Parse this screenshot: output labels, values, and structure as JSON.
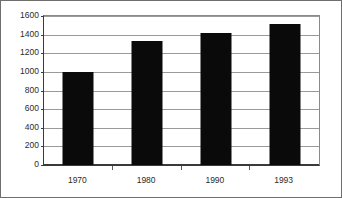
{
  "chart_data": {
    "type": "bar",
    "title": "",
    "subtitle": "",
    "xlabel": "",
    "ylabel": "",
    "categories": [
      "1970",
      "1980",
      "1990",
      "1993"
    ],
    "values": [
      1000,
      1330,
      1420,
      1510
    ],
    "series": [
      {
        "name": "",
        "values": [
          1000,
          1330,
          1420,
          1510
        ]
      }
    ],
    "ylim": [
      0,
      1600
    ],
    "ytick_labels": [
      "0",
      "200",
      "400",
      "600",
      "800",
      "1000",
      "1200",
      "1400",
      "1600"
    ],
    "ytick_values": [
      0,
      200,
      400,
      600,
      800,
      1000,
      1200,
      1400,
      1600
    ],
    "grid": true,
    "grid_axis": "y",
    "legend": false,
    "legend_position": "none",
    "annotations": [],
    "colors": {
      "bar": "#0a0a0a",
      "gridline": "#9a9a9a",
      "axis": "#3a3a3a",
      "frame": "#8a8a8a",
      "text": "#2b2b2b",
      "background": "#ffffff",
      "image_border": "#6e6e6e"
    }
  }
}
